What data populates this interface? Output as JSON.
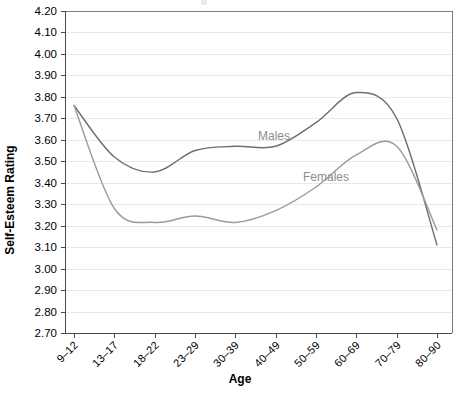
{
  "chart_data": {
    "type": "line",
    "title": "",
    "xlabel": "Age",
    "ylabel": "Self-Esteem Rating",
    "categories": [
      "9–12",
      "13–17",
      "18–22",
      "23–29",
      "30–39",
      "40–49",
      "50–59",
      "60–69",
      "70–79",
      "80–90"
    ],
    "ylim": [
      2.7,
      4.2
    ],
    "ytick_step": 0.1,
    "ytick_labels": [
      "4.20",
      "4.10",
      "4.00",
      "3.90",
      "3.80",
      "3.70",
      "3.60",
      "3.50",
      "3.40",
      "3.30",
      "3.20",
      "3.10",
      "3.00",
      "2.90",
      "2.80",
      "2.70"
    ],
    "grid": true,
    "legend": "inline-labels",
    "series": [
      {
        "name": "Males",
        "color": "#6e6e6e",
        "label_text": "Males",
        "values": [
          3.76,
          3.52,
          3.45,
          3.55,
          3.57,
          3.57,
          3.68,
          3.82,
          3.7,
          3.11
        ]
      },
      {
        "name": "Females",
        "color": "#9b9b9b",
        "label_text": "Females",
        "values": [
          3.76,
          3.28,
          3.215,
          3.245,
          3.215,
          3.27,
          3.38,
          3.53,
          3.57,
          3.18
        ]
      }
    ],
    "annotations": [
      {
        "text": "Males",
        "x_category": "50–59",
        "y_value": 3.62
      },
      {
        "text": "Females",
        "x_category": "60–69",
        "y_value": 3.43
      }
    ]
  },
  "axes": {
    "y_title": "Self-Esteem Rating",
    "x_title": "Age"
  }
}
